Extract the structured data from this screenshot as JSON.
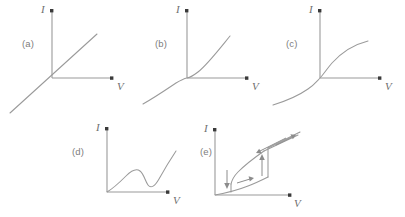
{
  "figure": {
    "background_color": "#ffffff",
    "line_color": "#9a9a9a",
    "arrow_color": "#3a3a3a",
    "label_color": "#7d7d7d",
    "width": 405,
    "height": 217
  },
  "axis_labels": {
    "current": "I",
    "voltage": "V"
  },
  "panels": [
    {
      "id": "a",
      "label": "(a)",
      "axis_y_label": "I",
      "axis_x_label": "V",
      "curve_type": "linear",
      "description": "straight line through origin, positive constant slope"
    },
    {
      "id": "b",
      "label": "(b)",
      "axis_y_label": "I",
      "axis_x_label": "V",
      "curve_type": "cubic-flat",
      "description": "gently S-shaped cubic, flat near origin, rising at both ends"
    },
    {
      "id": "c",
      "label": "(c)",
      "axis_y_label": "I",
      "axis_x_label": "V",
      "curve_type": "sublinear-saturating",
      "description": "steep through origin then saturating, odd-symmetric"
    },
    {
      "id": "d",
      "label": "(d)",
      "axis_y_label": "I",
      "axis_x_label": "V",
      "curve_type": "n-shaped-ndr",
      "description": "N-shaped curve from origin: rise, local maximum, dip to local minimum, then rise"
    },
    {
      "id": "e",
      "label": "(e)",
      "axis_y_label": "I",
      "axis_x_label": "V",
      "curve_type": "hysteresis-loop",
      "description": "S-type hysteresis loop with switching branches and directional arrows"
    }
  ]
}
